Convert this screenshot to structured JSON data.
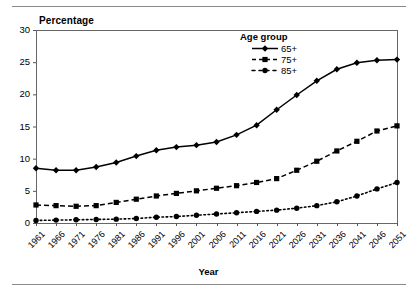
{
  "chart_data": {
    "type": "line",
    "title": "",
    "xlabel": "Year",
    "ylabel": "Percentage",
    "ylim": [
      0,
      30
    ],
    "yticks": [
      0,
      5,
      10,
      15,
      20,
      25,
      30
    ],
    "grid": false,
    "legend_position": "top-right-inside",
    "legend_title": "Age group",
    "categories": [
      "1961",
      "1966",
      "1971",
      "1976",
      "1981",
      "1986",
      "1991",
      "1996",
      "2001",
      "2006",
      "2011",
      "2016",
      "2021",
      "2026",
      "2031",
      "2036",
      "2041",
      "2046",
      "2051"
    ],
    "x": [
      1961,
      1966,
      1971,
      1976,
      1981,
      1986,
      1991,
      1996,
      2001,
      2006,
      2011,
      2016,
      2021,
      2026,
      2031,
      2036,
      2041,
      2046,
      2051
    ],
    "series": [
      {
        "name": "65+",
        "marker": "diamond",
        "linestyle": "solid",
        "color": "#000000",
        "values": [
          8.5,
          8.2,
          8.2,
          8.7,
          9.4,
          10.4,
          11.3,
          11.8,
          12.1,
          12.6,
          13.7,
          15.2,
          17.6,
          19.9,
          22.1,
          23.9,
          24.9,
          25.3,
          25.4
        ]
      },
      {
        "name": "75+",
        "marker": "square",
        "linestyle": "dashed",
        "color": "#000000",
        "values": [
          2.8,
          2.7,
          2.6,
          2.7,
          3.2,
          3.7,
          4.2,
          4.6,
          5.0,
          5.4,
          5.8,
          6.3,
          6.9,
          8.2,
          9.6,
          11.2,
          12.7,
          14.3,
          15.1
        ]
      },
      {
        "name": "85+",
        "marker": "circle",
        "linestyle": "dotted",
        "color": "#000000",
        "values": [
          0.4,
          0.45,
          0.5,
          0.55,
          0.6,
          0.7,
          0.9,
          1.0,
          1.2,
          1.4,
          1.6,
          1.8,
          2.0,
          2.3,
          2.7,
          3.3,
          4.2,
          5.3,
          6.3
        ]
      }
    ]
  },
  "axes": {
    "y_title": "Percentage",
    "x_title": "Year",
    "y_tick_labels": [
      "30",
      "25",
      "20",
      "15",
      "10",
      "5",
      "0"
    ],
    "x_tick_labels": [
      "1961",
      "1966",
      "1971",
      "1976",
      "1981",
      "1986",
      "1991",
      "1996",
      "2001",
      "2006",
      "2011",
      "2016",
      "2021",
      "2026",
      "2031",
      "2036",
      "2041",
      "2046",
      "2051"
    ]
  },
  "legend": {
    "title": "Age group",
    "entries": [
      {
        "label": "65+",
        "style": "solid-diamond"
      },
      {
        "label": "75+",
        "style": "solid-square"
      },
      {
        "label": "85+",
        "style": "dashed-diamond"
      }
    ]
  },
  "colors": {
    "series": "#000000",
    "axis": "#555555",
    "rule": "#8a8a8a",
    "background": "#ffffff"
  }
}
